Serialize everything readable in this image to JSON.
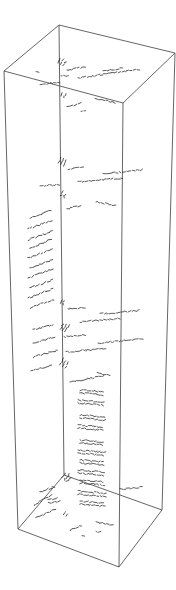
{
  "figure": {
    "type": "3d-wireframe-box-with-scattered-labels",
    "background": "#ffffff",
    "edge_color": "#555555",
    "mark_color": "#222222",
    "box": {
      "top": {
        "back": [
          59,
          25
        ],
        "left": [
          4,
          71
        ],
        "front": [
          123,
          103
        ],
        "right": [
          175,
          53
        ]
      },
      "bottom": {
        "back": [
          64,
          475
        ],
        "left": [
          18,
          529
        ],
        "front": [
          119,
          567
        ],
        "right": [
          162,
          510
        ]
      }
    },
    "label_clusters": [
      {
        "x": 58,
        "y": 63,
        "w": 6,
        "h": 8,
        "angle": -60
      },
      {
        "x": 67,
        "y": 70,
        "w": 18,
        "h": 3,
        "angle": -10
      },
      {
        "x": 36,
        "y": 72,
        "w": 4,
        "h": 3,
        "angle": 0
      },
      {
        "x": 103,
        "y": 71,
        "w": 18,
        "h": 3,
        "angle": -8
      },
      {
        "x": 78,
        "y": 78,
        "w": 60,
        "h": 3,
        "angle": -8
      },
      {
        "x": 40,
        "y": 84,
        "w": 20,
        "h": 3,
        "angle": -5
      },
      {
        "x": 61,
        "y": 76,
        "w": 6,
        "h": 3,
        "angle": 0
      },
      {
        "x": 61,
        "y": 96,
        "w": 4,
        "h": 6,
        "angle": -60
      },
      {
        "x": 95,
        "y": 99,
        "w": 20,
        "h": 3,
        "angle": 10
      },
      {
        "x": 67,
        "y": 107,
        "w": 14,
        "h": 3,
        "angle": -15
      },
      {
        "x": 81,
        "y": 111,
        "w": 3,
        "h": 2,
        "angle": 0
      },
      {
        "x": 58,
        "y": 163,
        "w": 6,
        "h": 8,
        "angle": -60
      },
      {
        "x": 68,
        "y": 169,
        "w": 16,
        "h": 3,
        "angle": -8
      },
      {
        "x": 103,
        "y": 174,
        "w": 40,
        "h": 3,
        "angle": -6
      },
      {
        "x": 78,
        "y": 182,
        "w": 44,
        "h": 3,
        "angle": -5
      },
      {
        "x": 40,
        "y": 186,
        "w": 18,
        "h": 3,
        "angle": -4
      },
      {
        "x": 61,
        "y": 196,
        "w": 4,
        "h": 6,
        "angle": -60
      },
      {
        "x": 96,
        "y": 202,
        "w": 18,
        "h": 3,
        "angle": 10
      },
      {
        "x": 67,
        "y": 209,
        "w": 14,
        "h": 3,
        "angle": -15
      },
      {
        "x": 30,
        "y": 218,
        "w": 22,
        "h": 3,
        "angle": -20
      },
      {
        "x": 28,
        "y": 229,
        "w": 24,
        "h": 3,
        "angle": -20
      },
      {
        "x": 28,
        "y": 240,
        "w": 26,
        "h": 4,
        "angle": -20
      },
      {
        "x": 30,
        "y": 249,
        "w": 24,
        "h": 3,
        "angle": -25
      },
      {
        "x": 28,
        "y": 258,
        "w": 26,
        "h": 3,
        "angle": -20
      },
      {
        "x": 30,
        "y": 268,
        "w": 24,
        "h": 3,
        "angle": -20
      },
      {
        "x": 28,
        "y": 278,
        "w": 26,
        "h": 3,
        "angle": -20
      },
      {
        "x": 30,
        "y": 288,
        "w": 24,
        "h": 3,
        "angle": -20
      },
      {
        "x": 28,
        "y": 298,
        "w": 26,
        "h": 3,
        "angle": -20
      },
      {
        "x": 30,
        "y": 308,
        "w": 24,
        "h": 3,
        "angle": -20
      },
      {
        "x": 60,
        "y": 303,
        "w": 4,
        "h": 6,
        "angle": -60
      },
      {
        "x": 68,
        "y": 309,
        "w": 16,
        "h": 3,
        "angle": -5
      },
      {
        "x": 100,
        "y": 314,
        "w": 40,
        "h": 3,
        "angle": -5
      },
      {
        "x": 80,
        "y": 322,
        "w": 40,
        "h": 3,
        "angle": -5
      },
      {
        "x": 33,
        "y": 330,
        "w": 22,
        "h": 4,
        "angle": -15
      },
      {
        "x": 60,
        "y": 329,
        "w": 6,
        "h": 8,
        "angle": -60
      },
      {
        "x": 64,
        "y": 337,
        "w": 22,
        "h": 3,
        "angle": -5
      },
      {
        "x": 33,
        "y": 343,
        "w": 22,
        "h": 4,
        "angle": -15
      },
      {
        "x": 98,
        "y": 343,
        "w": 44,
        "h": 3,
        "angle": -5
      },
      {
        "x": 66,
        "y": 352,
        "w": 40,
        "h": 3,
        "angle": -5
      },
      {
        "x": 33,
        "y": 357,
        "w": 24,
        "h": 4,
        "angle": -15
      },
      {
        "x": 60,
        "y": 365,
        "w": 6,
        "h": 8,
        "angle": -60
      },
      {
        "x": 31,
        "y": 371,
        "w": 22,
        "h": 4,
        "angle": -15
      },
      {
        "x": 97,
        "y": 373,
        "w": 14,
        "h": 3,
        "angle": 10
      },
      {
        "x": 70,
        "y": 382,
        "w": 34,
        "h": 3,
        "angle": -10
      },
      {
        "x": 80,
        "y": 390,
        "w": 24,
        "h": 6,
        "angle": 5
      },
      {
        "x": 78,
        "y": 400,
        "w": 26,
        "h": 6,
        "angle": 5
      },
      {
        "x": 80,
        "y": 415,
        "w": 24,
        "h": 6,
        "angle": 5
      },
      {
        "x": 78,
        "y": 425,
        "w": 26,
        "h": 6,
        "angle": 5
      },
      {
        "x": 80,
        "y": 440,
        "w": 24,
        "h": 6,
        "angle": 5
      },
      {
        "x": 78,
        "y": 450,
        "w": 26,
        "h": 6,
        "angle": 5
      },
      {
        "x": 80,
        "y": 460,
        "w": 24,
        "h": 6,
        "angle": 5
      },
      {
        "x": 78,
        "y": 470,
        "w": 26,
        "h": 6,
        "angle": 5
      },
      {
        "x": 80,
        "y": 480,
        "w": 24,
        "h": 6,
        "angle": 5
      },
      {
        "x": 120,
        "y": 489,
        "w": 20,
        "h": 3,
        "angle": -5
      },
      {
        "x": 78,
        "y": 491,
        "w": 26,
        "h": 6,
        "angle": 5
      },
      {
        "x": 80,
        "y": 501,
        "w": 24,
        "h": 6,
        "angle": 5
      },
      {
        "x": 62,
        "y": 478,
        "w": 6,
        "h": 8,
        "angle": -50
      },
      {
        "x": 40,
        "y": 492,
        "w": 14,
        "h": 3,
        "angle": -20
      },
      {
        "x": 34,
        "y": 505,
        "w": 22,
        "h": 4,
        "angle": -30
      },
      {
        "x": 48,
        "y": 500,
        "w": 10,
        "h": 6,
        "angle": -10
      },
      {
        "x": 36,
        "y": 518,
        "w": 20,
        "h": 3,
        "angle": -25
      },
      {
        "x": 64,
        "y": 515,
        "w": 4,
        "h": 6,
        "angle": -60
      },
      {
        "x": 96,
        "y": 522,
        "w": 16,
        "h": 3,
        "angle": 10
      },
      {
        "x": 70,
        "y": 530,
        "w": 12,
        "h": 3,
        "angle": -20
      },
      {
        "x": 82,
        "y": 536,
        "w": 3,
        "h": 3,
        "angle": 0
      },
      {
        "x": 96,
        "y": 532,
        "w": 3,
        "h": 3,
        "angle": 0
      }
    ]
  }
}
